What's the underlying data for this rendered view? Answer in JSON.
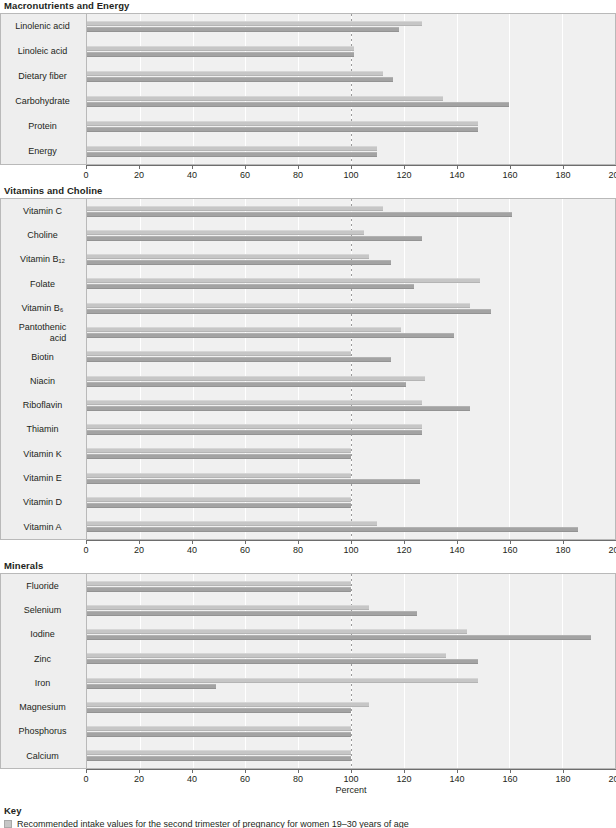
{
  "chart_data": {
    "type": "bar",
    "orientation": "horizontal",
    "title": "",
    "xlabel": "Percent",
    "ylabel": "",
    "xlim": [
      0,
      200
    ],
    "xticks": [
      0,
      20,
      40,
      60,
      80,
      100,
      120,
      140,
      160,
      180,
      200
    ],
    "grid": true,
    "reference_line": 100,
    "legend_position": "bottom",
    "series": [
      {
        "name": "Recommended intake values for the second trimester of pregnancy for women 19–30 years of age",
        "key": "a",
        "color": "#c6c6c6"
      },
      {
        "name": "Usual intake values for women 19–30 years of age",
        "key": "b",
        "color": "#a3a3a3"
      }
    ],
    "panels": [
      {
        "title": "Macronutrients and Energy",
        "categories": [
          "Linolenic acid",
          "Linoleic acid",
          "Dietary fiber",
          "Carbohydrate",
          "Protein",
          "Energy"
        ],
        "values_a": [
          127,
          101,
          112,
          135,
          148,
          110
        ],
        "values_b": [
          118,
          101,
          116,
          160,
          148,
          110
        ]
      },
      {
        "title": "Vitamins and Choline",
        "categories": [
          "Vitamin C",
          "Choline",
          "Vitamin B₁₂",
          "Folate",
          "Vitamin B₆",
          "Pantothenic acid",
          "Biotin",
          "Niacin",
          "Riboflavin",
          "Thiamin",
          "Vitamin K",
          "Vitamin E",
          "Vitamin D",
          "Vitamin A"
        ],
        "values_a": [
          112,
          105,
          107,
          149,
          145,
          119,
          100,
          128,
          127,
          127,
          100,
          100,
          100,
          110
        ],
        "values_b": [
          161,
          127,
          115,
          124,
          153,
          139,
          115,
          121,
          145,
          127,
          100,
          126,
          100,
          186
        ]
      },
      {
        "title": "Minerals",
        "categories": [
          "Fluoride",
          "Selenium",
          "Iodine",
          "Zinc",
          "Iron",
          "Magnesium",
          "Phosphorus",
          "Calcium"
        ],
        "values_a": [
          100,
          107,
          144,
          136,
          148,
          107,
          100,
          100
        ],
        "values_b": [
          100,
          125,
          191,
          148,
          49,
          100,
          100,
          100
        ]
      }
    ]
  },
  "key": {
    "title": "Key",
    "items": [
      "Recommended intake values for the second trimester of pregnancy for women 19–30 years of age"
    ]
  }
}
